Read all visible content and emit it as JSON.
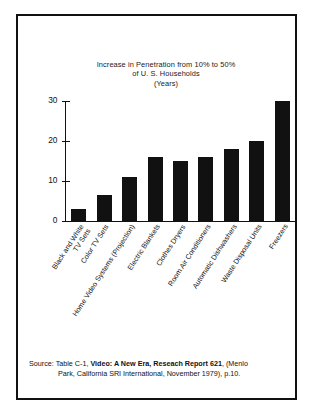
{
  "chart_data": {
    "type": "bar",
    "title": "Increase in Penetration from 10% to 50% of U. S. Households (Years)",
    "title_lines": [
      "Increase in Penetration from 10% to 50%",
      "of U. S. Households",
      "(Years)"
    ],
    "xlabel": "",
    "ylabel": "",
    "ylim": [
      0,
      30
    ],
    "yticks": [
      0,
      10,
      20,
      30
    ],
    "ytick_labels": [
      "0",
      "10",
      "20",
      "30"
    ],
    "grid": false,
    "legend": "none",
    "bar_color": "#111111",
    "categories": [
      "Black and White TV Sets",
      "Color TV Sets",
      "Home Video Systems (Projection)",
      "Electric Blankets",
      "Clothes Dryers",
      "Room Air Conditioners",
      "Automatic Dishwashers",
      "Waste Disposal Units",
      "Freezers"
    ],
    "category_lines": [
      [
        "Black and White",
        "TV Sets"
      ],
      [
        "Color TV Sets",
        ""
      ],
      [
        "Home Video Systems (Projection)",
        ""
      ],
      [
        "Electric Blankets",
        ""
      ],
      [
        "Clothes Dryers",
        ""
      ],
      [
        "Room Air Conditioners",
        ""
      ],
      [
        "Automatic Dishwashers",
        ""
      ],
      [
        "Waste Disposal Units",
        ""
      ],
      [
        "Freezers",
        ""
      ]
    ],
    "values": [
      3,
      6.5,
      11,
      16,
      15,
      16,
      18,
      20,
      30
    ]
  },
  "source": {
    "line1_prefix": "Source:  Table C-1, ",
    "line1_bold": "Video: A New Era, Reseach Report 621",
    "line1_suffix": ", (Menlo",
    "line2": "Park, California SRI International, November 1979), p.10."
  }
}
